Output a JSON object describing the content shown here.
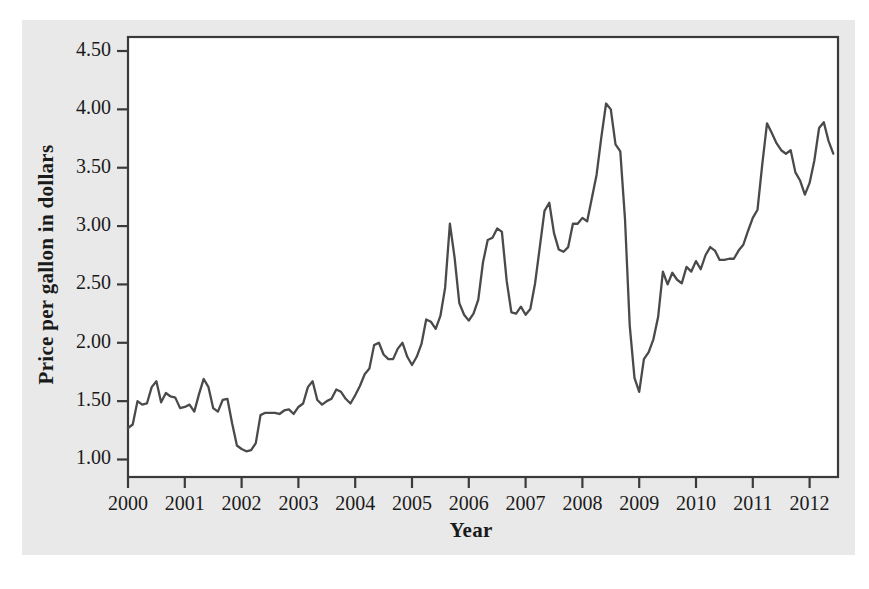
{
  "figure": {
    "background_color": "#e9e9e9",
    "page_color": "#ffffff",
    "plot_background": "#ffffff",
    "frame_color": "#3a3a3a",
    "line_color": "#4a4a4a"
  },
  "chart_data": {
    "type": "line",
    "title": "",
    "xlabel": "Year",
    "ylabel": "Price per gallon in dollars",
    "xlim": [
      2000,
      2012.5
    ],
    "ylim": [
      0.85,
      4.62
    ],
    "grid": false,
    "legend": null,
    "xticks": [
      "2000",
      "2001",
      "2002",
      "2003",
      "2004",
      "2005",
      "2006",
      "2007",
      "2008",
      "2009",
      "2010",
      "2011",
      "2012"
    ],
    "xtick_values": [
      2000,
      2001,
      2002,
      2003,
      2004,
      2005,
      2006,
      2007,
      2008,
      2009,
      2010,
      2011,
      2012
    ],
    "yticks": [
      "1.00",
      "1.50",
      "2.00",
      "2.50",
      "3.00",
      "3.50",
      "4.00",
      "4.50"
    ],
    "ytick_values": [
      1.0,
      1.5,
      2.0,
      2.5,
      3.0,
      3.5,
      4.0,
      4.5
    ],
    "series": [
      {
        "name": "Price per gallon",
        "x": [
          2000.0,
          2000.083,
          2000.167,
          2000.25,
          2000.333,
          2000.417,
          2000.5,
          2000.583,
          2000.667,
          2000.75,
          2000.833,
          2000.917,
          2001.0,
          2001.083,
          2001.167,
          2001.25,
          2001.333,
          2001.417,
          2001.5,
          2001.583,
          2001.667,
          2001.75,
          2001.833,
          2001.917,
          2002.0,
          2002.083,
          2002.167,
          2002.25,
          2002.333,
          2002.417,
          2002.5,
          2002.583,
          2002.667,
          2002.75,
          2002.833,
          2002.917,
          2003.0,
          2003.083,
          2003.167,
          2003.25,
          2003.333,
          2003.417,
          2003.5,
          2003.583,
          2003.667,
          2003.75,
          2003.833,
          2003.917,
          2004.0,
          2004.083,
          2004.167,
          2004.25,
          2004.333,
          2004.417,
          2004.5,
          2004.583,
          2004.667,
          2004.75,
          2004.833,
          2004.917,
          2005.0,
          2005.083,
          2005.167,
          2005.25,
          2005.333,
          2005.417,
          2005.5,
          2005.583,
          2005.667,
          2005.75,
          2005.833,
          2005.917,
          2006.0,
          2006.083,
          2006.167,
          2006.25,
          2006.333,
          2006.417,
          2006.5,
          2006.583,
          2006.667,
          2006.75,
          2006.833,
          2006.917,
          2007.0,
          2007.083,
          2007.167,
          2007.25,
          2007.333,
          2007.417,
          2007.5,
          2007.583,
          2007.667,
          2007.75,
          2007.833,
          2007.917,
          2008.0,
          2008.083,
          2008.167,
          2008.25,
          2008.333,
          2008.417,
          2008.5,
          2008.583,
          2008.667,
          2008.75,
          2008.833,
          2008.917,
          2009.0,
          2009.083,
          2009.167,
          2009.25,
          2009.333,
          2009.417,
          2009.5,
          2009.583,
          2009.667,
          2009.75,
          2009.833,
          2009.917,
          2010.0,
          2010.083,
          2010.167,
          2010.25,
          2010.333,
          2010.417,
          2010.5,
          2010.583,
          2010.667,
          2010.75,
          2010.833,
          2010.917,
          2011.0,
          2011.083,
          2011.167,
          2011.25,
          2011.333,
          2011.417,
          2011.5,
          2011.583,
          2011.667,
          2011.75,
          2011.833,
          2011.917,
          2012.0,
          2012.083,
          2012.167,
          2012.25,
          2012.333,
          2012.417
        ],
        "values": [
          1.27,
          1.3,
          1.5,
          1.47,
          1.48,
          1.62,
          1.67,
          1.49,
          1.57,
          1.54,
          1.53,
          1.44,
          1.45,
          1.47,
          1.41,
          1.56,
          1.69,
          1.62,
          1.44,
          1.41,
          1.51,
          1.52,
          1.31,
          1.12,
          1.09,
          1.07,
          1.08,
          1.14,
          1.38,
          1.4,
          1.4,
          1.4,
          1.39,
          1.42,
          1.43,
          1.39,
          1.45,
          1.48,
          1.62,
          1.67,
          1.51,
          1.47,
          1.5,
          1.52,
          1.6,
          1.58,
          1.52,
          1.48,
          1.55,
          1.63,
          1.73,
          1.78,
          1.98,
          2.0,
          1.9,
          1.86,
          1.86,
          1.95,
          2.0,
          1.88,
          1.81,
          1.88,
          1.99,
          2.2,
          2.18,
          2.12,
          2.23,
          2.47,
          3.02,
          2.73,
          2.34,
          2.24,
          2.19,
          2.25,
          2.37,
          2.69,
          2.88,
          2.9,
          2.98,
          2.95,
          2.53,
          2.26,
          2.25,
          2.31,
          2.24,
          2.29,
          2.51,
          2.82,
          3.13,
          3.2,
          2.94,
          2.8,
          2.78,
          2.82,
          3.02,
          3.02,
          3.07,
          3.04,
          3.24,
          3.44,
          3.76,
          4.05,
          4.0,
          3.7,
          3.64,
          3.06,
          2.15,
          1.7,
          1.58,
          1.86,
          1.92,
          2.03,
          2.22,
          2.61,
          2.5,
          2.6,
          2.54,
          2.51,
          2.65,
          2.61,
          2.7,
          2.63,
          2.75,
          2.82,
          2.79,
          2.71,
          2.71,
          2.72,
          2.72,
          2.79,
          2.84,
          2.96,
          3.07,
          3.14,
          3.53,
          3.88,
          3.8,
          3.71,
          3.65,
          3.62,
          3.65,
          3.46,
          3.39,
          3.27,
          3.37,
          3.56,
          3.84,
          3.89,
          3.73,
          3.62
        ]
      }
    ]
  }
}
